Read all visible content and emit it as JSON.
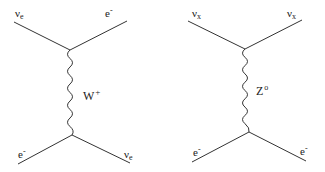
{
  "diagrams": [
    {
      "name": "charged-current",
      "top_left": "νe",
      "top_right": "e⁻",
      "propagator": "W",
      "propagator_sup": "+",
      "bottom_left": "e⁻",
      "bottom_right": "νe",
      "top_left_base": "ν",
      "top_left_sub": "e",
      "bottom_right_base": "ν",
      "bottom_right_sub": "e",
      "e_base": "e",
      "e_sup": "-"
    },
    {
      "name": "neutral-current",
      "top_left": "νx",
      "top_right": "νx",
      "propagator": "Z",
      "propagator_sup": "o",
      "bottom_left": "e⁻",
      "bottom_right": "e⁻",
      "nu_base": "ν",
      "nu_sub": "x",
      "e_base": "e",
      "e_sup": "-"
    }
  ],
  "colors": {
    "line": "#333333",
    "text": "#222222"
  }
}
